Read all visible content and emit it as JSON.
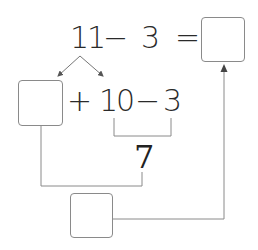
{
  "equation": {
    "left_operand": "11",
    "operator": "−",
    "right_operand": "3",
    "equals": "=",
    "answer_box": ""
  },
  "decomposition": {
    "part_box": "",
    "plus": "+",
    "ten": "10",
    "minus": "−",
    "subtrahend": "3"
  },
  "intermediate_result": "7",
  "final_box": "",
  "colors": {
    "line": "#8a8a8a",
    "text": "#2a2a2a"
  }
}
